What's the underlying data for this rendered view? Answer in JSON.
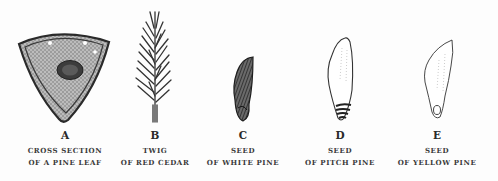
{
  "figures": [
    {
      "letter": "A",
      "line1": "CROSS SECTION",
      "line2": "OF A PINE LEAF",
      "illustration": "pine-leaf-cross-section"
    },
    {
      "letter": "B",
      "line1": "TWIG",
      "line2": "OF RED CEDAR",
      "illustration": "red-cedar-twig"
    },
    {
      "letter": "C",
      "line1": "SEED",
      "line2": "OF WHITE PINE",
      "illustration": "white-pine-seed"
    },
    {
      "letter": "D",
      "line1": "SEED",
      "line2": "OF PITCH PINE",
      "illustration": "pitch-pine-seed"
    },
    {
      "letter": "E",
      "line1": "SEED",
      "line2": "OF YELLOW PINE",
      "illustration": "yellow-pine-seed"
    }
  ],
  "colors": {
    "background": "#fdfdfd",
    "ink": "#2a2a2a"
  }
}
